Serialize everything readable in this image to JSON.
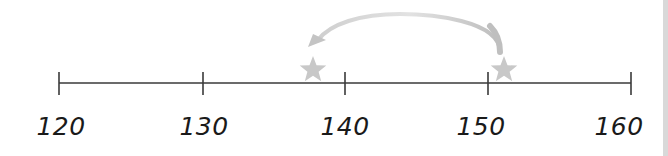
{
  "number_line": {
    "min": 120,
    "max": 160,
    "tick_labels": [
      "120",
      "130",
      "140",
      "150",
      "160"
    ],
    "markers": [
      {
        "name": "left-star",
        "approx_value": 137.5,
        "shape": "star",
        "color": "#c8c8c8"
      },
      {
        "name": "right-star",
        "approx_value": 151,
        "shape": "star",
        "color": "#c8c8c8"
      }
    ],
    "jump_arrow": {
      "from_value": 151,
      "to_value": 137.5,
      "direction": "left",
      "color": "#c8c8c8"
    },
    "colors": {
      "axis": "#3a3a3a",
      "label": "#1a1a1a",
      "marker": "#c8c8c8",
      "edge_strip": "#d9d9d9"
    }
  }
}
